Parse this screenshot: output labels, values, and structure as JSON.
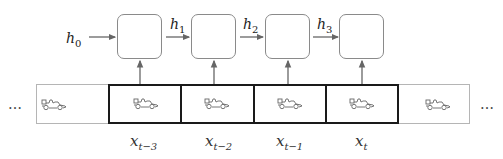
{
  "hidden_states": {
    "initial": {
      "base": "h",
      "sub": "0"
    },
    "transitions": [
      {
        "base": "h",
        "sub": "1"
      },
      {
        "base": "h",
        "sub": "2"
      },
      {
        "base": "h",
        "sub": "3"
      }
    ]
  },
  "rnn_cells": 4,
  "frames": {
    "ellipsis_left": "…",
    "ellipsis_right": "…",
    "inputs": [
      {
        "base": "x",
        "sub": "t−3"
      },
      {
        "base": "x",
        "sub": "t−2"
      },
      {
        "base": "x",
        "sub": "t−1"
      },
      {
        "base": "x",
        "sub": "t"
      }
    ],
    "icon": "race-car-icon"
  },
  "colors": {
    "cell_border": "#8a8a8a",
    "arrow": "#666666",
    "bold_frame": "#1a1a1a",
    "light_frame": "#b5b5b5"
  }
}
